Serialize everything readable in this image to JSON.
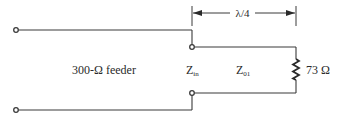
{
  "diagram": {
    "type": "circuit-schematic",
    "feeder_label": "300-Ω feeder",
    "input_impedance_label": {
      "main": "Z",
      "sub": "in"
    },
    "line_impedance_label": {
      "main": "Z",
      "sub": "01"
    },
    "load_label": "73 Ω",
    "length_label": "λ/4",
    "colors": {
      "line": "#3a3a3a",
      "text": "#2a2a2a",
      "background": "#ffffff"
    }
  }
}
